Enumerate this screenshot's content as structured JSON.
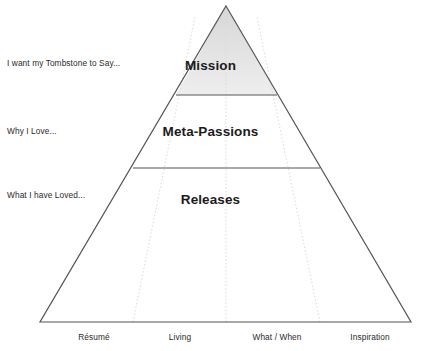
{
  "diagram": {
    "type": "pyramid",
    "title": "",
    "colors": {
      "outline": "#555555",
      "divider": "#555555",
      "apex_fill_top": "#d9d9d9",
      "apex_fill_bottom": "#ececec",
      "body_fill": "#ffffff",
      "dotted_guide": "#d8d8d8",
      "text": "#1b1b1b",
      "side_text": "#2a2a2a"
    },
    "geometry": {
      "apex_x": 226,
      "apex_y": 6,
      "base_left_x": 40,
      "base_right_x": 411,
      "base_y": 322,
      "divider_1_y": 95,
      "divider_2_y": 168,
      "guide_base_x": [
        133,
        226,
        320
      ]
    },
    "tiers": [
      {
        "id": "mission",
        "label": "Mission",
        "side_label": "I want my Tombstone to Say...",
        "shaded": true
      },
      {
        "id": "meta-passions",
        "label": "Meta-Passions",
        "side_label": "Why I Love...",
        "shaded": false
      },
      {
        "id": "releases",
        "label": "Releases",
        "side_label": "What I have Loved...",
        "shaded": false
      }
    ],
    "axis_labels": [
      {
        "id": "resume",
        "label": "Résumé",
        "x": 94
      },
      {
        "id": "living",
        "label": "Living",
        "x": 180
      },
      {
        "id": "what-when",
        "label": "What / When",
        "x": 277
      },
      {
        "id": "inspiration",
        "label": "Inspiration",
        "x": 370
      }
    ]
  }
}
